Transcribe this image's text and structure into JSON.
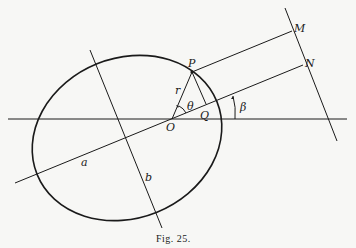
{
  "figure": {
    "caption": "Fig. 25.",
    "labels": {
      "P": "P",
      "M": "M",
      "N": "N",
      "O": "O",
      "Q": "Q",
      "r": "r",
      "theta": "θ",
      "beta": "β",
      "a": "a",
      "b": "b"
    }
  }
}
